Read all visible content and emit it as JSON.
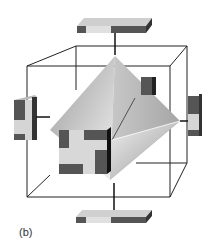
{
  "figure": {
    "label": "(b)",
    "colors": {
      "cube_edge": "#222222",
      "octahedron_light": "#e8e8e8",
      "octahedron_mid": "#bcbcbc",
      "octahedron_dark": "#9a9a9a",
      "tile_dark": "#555555",
      "tile_light": "#d8d8d8"
    }
  }
}
